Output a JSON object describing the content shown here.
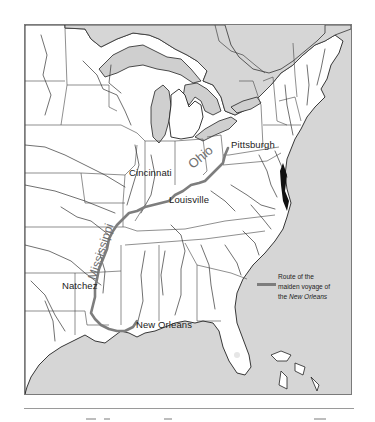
{
  "map": {
    "title": "Route of the maiden voyage of the New Orleans",
    "colors": {
      "water": "#d6d6d6",
      "land": "#ffffff",
      "route": "#7d7d7d",
      "outline": "#222222",
      "frame": "#7a7a7a"
    },
    "cities": [
      {
        "name": "Pittsburgh",
        "x": 229,
        "y": 138
      },
      {
        "name": "Cincinnati",
        "x": 128,
        "y": 166
      },
      {
        "name": "Louisville",
        "x": 168,
        "y": 193
      },
      {
        "name": "Natchez",
        "x": 61,
        "y": 278
      },
      {
        "name": "New Orleans",
        "x": 135,
        "y": 318
      }
    ],
    "rivers": [
      {
        "name": "Ohio",
        "x": 185,
        "y": 160,
        "rotation": -40
      },
      {
        "name": "Mississippi",
        "x": 60,
        "y": 222,
        "rotation": -72
      }
    ],
    "legend": {
      "line1": "Route of the",
      "line2": "maiden voyage of",
      "line3_prefix": "the ",
      "line3_italic": "New Orleans"
    },
    "route_stops": [
      "Pittsburgh",
      "Cincinnati",
      "Louisville",
      "Natchez",
      "New Orleans"
    ]
  }
}
